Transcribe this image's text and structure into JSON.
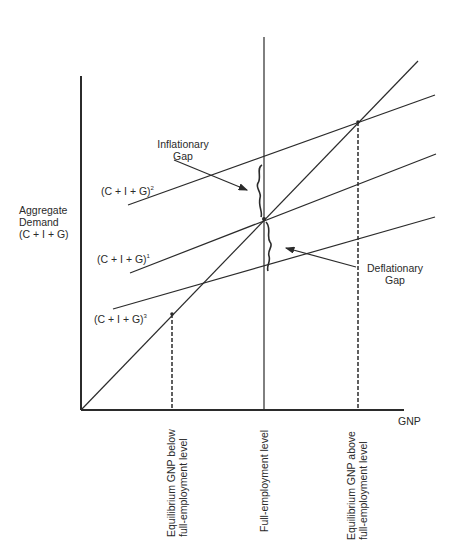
{
  "diagram": {
    "title": "",
    "y_axis_label": [
      "Aggregate",
      "Demand",
      "(C + I + G)"
    ],
    "x_axis_label": "GNP",
    "curves": [
      {
        "id": "cig2",
        "base": "(C + I + G)",
        "superscript": "2"
      },
      {
        "id": "cig1",
        "base": "(C + I + G)",
        "superscript": "1"
      },
      {
        "id": "cig3",
        "base": "(C + I + G)",
        "superscript": "3"
      }
    ],
    "annotations": {
      "inflationary_gap": [
        "Inflationary",
        "Gap"
      ],
      "deflationary_gap": [
        "Deflationary",
        "Gap"
      ]
    },
    "x_markers": {
      "below": [
        "Equilibrium GNP below",
        "full-employment level"
      ],
      "full": [
        "Full-employment level"
      ],
      "above": [
        "Equilibrium GNP above",
        "full-employment level"
      ]
    },
    "colors": {
      "line": "#2b2b2b",
      "background": "#ffffff"
    }
  }
}
